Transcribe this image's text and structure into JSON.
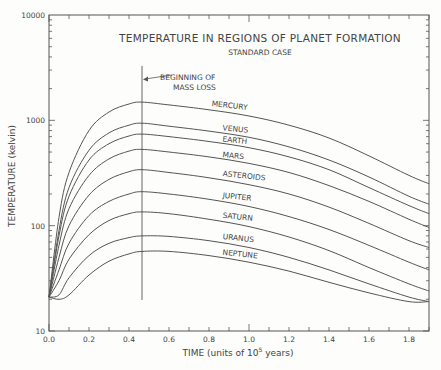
{
  "chart_data": {
    "type": "line",
    "title": "TEMPERATURE IN REGIONS OF PLANET FORMATION",
    "subtitle": "STANDARD CASE",
    "xlabel": "TIME (units of 10^5 years)",
    "xlabel_parts": {
      "pre": "TIME (units of 10",
      "sup": "5",
      "post": " years)"
    },
    "ylabel": "TEMPERATURE (kelvin)",
    "yscale": "log",
    "xlim": [
      0.0,
      1.9
    ],
    "ylim": [
      10,
      10000
    ],
    "x_ticks": [
      "0.0",
      "0.2",
      "0.4",
      "0.6",
      "0.8",
      "1.0",
      "1.2",
      "1.4",
      "1.6",
      "1.8"
    ],
    "y_ticks": [
      "10",
      "100",
      "1000",
      "10000"
    ],
    "grid": false,
    "annotations": [
      {
        "text_line1": "BEGINNING OF",
        "text_line2": "MASS LOSS",
        "x": 0.465,
        "type": "vertical-line-with-arrow"
      }
    ],
    "x": [
      0.0,
      0.05,
      0.1,
      0.2,
      0.3,
      0.4,
      0.465,
      0.6,
      0.8,
      1.0,
      1.2,
      1.4,
      1.6,
      1.8,
      1.9
    ],
    "series": [
      {
        "name": "MERCURY",
        "values": [
          21,
          120,
          320,
          800,
          1200,
          1430,
          1490,
          1400,
          1260,
          1100,
          900,
          680,
          460,
          300,
          250
        ]
      },
      {
        "name": "VENUS",
        "values": [
          21,
          90,
          230,
          520,
          760,
          900,
          940,
          880,
          790,
          690,
          560,
          420,
          290,
          190,
          160
        ]
      },
      {
        "name": "EARTH",
        "values": [
          21,
          80,
          190,
          420,
          600,
          710,
          740,
          700,
          630,
          550,
          450,
          340,
          230,
          155,
          130
        ]
      },
      {
        "name": "MARS",
        "values": [
          21,
          65,
          145,
          300,
          430,
          510,
          530,
          500,
          450,
          390,
          320,
          240,
          170,
          115,
          96
        ]
      },
      {
        "name": "ASTEROIDS",
        "values": [
          21,
          50,
          100,
          195,
          275,
          325,
          340,
          320,
          285,
          245,
          200,
          150,
          105,
          72,
          62
        ]
      },
      {
        "name": "JUPITER",
        "values": [
          21,
          38,
          68,
          125,
          170,
          200,
          210,
          200,
          178,
          152,
          122,
          92,
          65,
          45,
          38
        ]
      },
      {
        "name": "SATURN",
        "values": [
          21,
          30,
          48,
          82,
          112,
          130,
          135,
          130,
          115,
          98,
          78,
          58,
          40,
          28,
          24
        ]
      },
      {
        "name": "URANUS",
        "values": [
          21,
          22,
          32,
          52,
          68,
          77,
          80,
          79,
          72,
          62,
          50,
          38,
          28,
          21,
          19
        ]
      },
      {
        "name": "NEPTUNE",
        "values": [
          21,
          20,
          22,
          34,
          46,
          54,
          57,
          57,
          52,
          45,
          37,
          29,
          23,
          19,
          19
        ]
      }
    ]
  }
}
